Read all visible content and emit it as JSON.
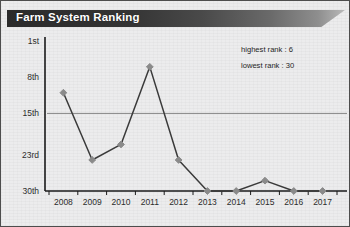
{
  "banner": {
    "title": "Farm System Ranking"
  },
  "annotations": {
    "highest": "highest rank : 6",
    "lowest": "lowest rank : 30"
  },
  "colors": {
    "banner_dark": "#2b2b2b",
    "banner_light": "#b9b9b9",
    "line": "#3a3a3a",
    "marker": "#8a8a8a",
    "axis": "#1a1a1a",
    "reference_line": "#7a7a7a",
    "background": "#ececed",
    "border": "#4d4d4d",
    "text": "#2c2c2c"
  },
  "chart_data": {
    "type": "line",
    "title": "Farm System Ranking",
    "xlabel": "",
    "ylabel": "",
    "categories": [
      "2008",
      "2009",
      "2010",
      "2011",
      "2012",
      "2013",
      "2014",
      "2015",
      "2016",
      "2017"
    ],
    "values": [
      11,
      24,
      21,
      6,
      24,
      30,
      30,
      28,
      30,
      30
    ],
    "ytick_labels": [
      "1st",
      "8th",
      "15th",
      "23rd",
      "30th"
    ],
    "ytick_values": [
      1,
      8,
      15,
      23,
      30
    ],
    "ylim": [
      1,
      30
    ],
    "y_inverted": true,
    "grid": false,
    "legend": "none",
    "reference_line": {
      "value": 15,
      "orientation": "horizontal"
    },
    "annotations": [
      "highest rank : 6",
      "lowest rank : 30"
    ],
    "marker": "diamond",
    "highest_rank": 6,
    "lowest_rank": 30
  }
}
